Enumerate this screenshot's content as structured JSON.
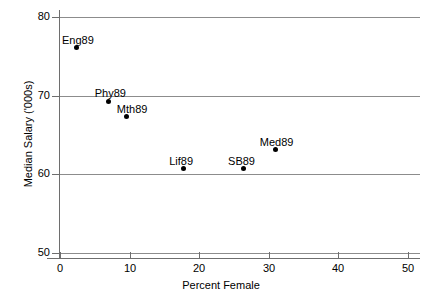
{
  "chart_data": {
    "type": "scatter",
    "title": "",
    "xlabel": "Percent Female",
    "ylabel": "Median Salary ('000s)",
    "xlim": [
      0,
      50
    ],
    "ylim": [
      50,
      80
    ],
    "xticks": [
      0,
      10,
      20,
      30,
      40,
      50
    ],
    "yticks": [
      50,
      60,
      70,
      80
    ],
    "xticklabels": [
      "0",
      "10",
      "20",
      "30",
      "40",
      "50"
    ],
    "yticklabels": [
      "50",
      "60",
      "70",
      "80"
    ],
    "grid": "horizontal",
    "legend": "none",
    "points": [
      {
        "label": "Eng89",
        "x": 2.3,
        "y": 76.1,
        "label_dx": -14,
        "label_dy": -13
      },
      {
        "label": "Phy89",
        "x": 7.0,
        "y": 69.3,
        "label_dx": -14,
        "label_dy": -13
      },
      {
        "label": "Mth89",
        "x": 9.6,
        "y": 67.3,
        "label_dx": -10,
        "label_dy": -13
      },
      {
        "label": "Lif89",
        "x": 17.7,
        "y": 60.7,
        "label_dx": -14,
        "label_dy": -13
      },
      {
        "label": "SB89",
        "x": 26.3,
        "y": 60.7,
        "label_dx": -15,
        "label_dy": -13
      },
      {
        "label": "Med89",
        "x": 31.0,
        "y": 63.1,
        "label_dx": -16,
        "label_dy": -13
      }
    ]
  },
  "colors": {
    "point": "#000000",
    "gridline": "#8c8c8c",
    "axis": "#6e6e6e",
    "background": "#ffffff",
    "text": "#000000"
  }
}
